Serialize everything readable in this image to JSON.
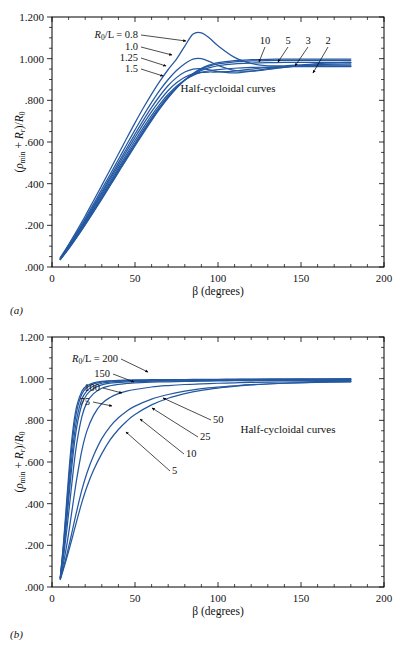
{
  "figure": {
    "background": "#ffffff",
    "curve_color": "#2458a0",
    "axis_color": "#000000"
  },
  "panels": [
    {
      "id": "a",
      "tag": "(a)",
      "annotation": "Half-cycloidal curves",
      "axis_label_x": "β (degrees)",
      "axis_label_y_parts": {
        "open": "(",
        "rho": "ρ",
        "rho_sub": "min",
        "plus": " + ",
        "R": "R",
        "R_sub": "r",
        "close": ")/",
        "R0": "R",
        "R0_sub": "0"
      },
      "series_legend_prefix": "R",
      "series_legend_prefix_sub": "0",
      "series_legend_text": "/L = 0.8",
      "left_labels": [
        "1.0",
        "1.25",
        "1.5"
      ],
      "right_labels": [
        "10",
        "5",
        "3",
        "2"
      ]
    },
    {
      "id": "b",
      "tag": "(b)",
      "annotation": "Half-cycloidal curves",
      "axis_label_x": "β (degrees)",
      "series_legend_text": "/L = 200",
      "left_labels": [
        "150",
        "100",
        "75"
      ],
      "right_labels": [
        "50",
        "25",
        "10",
        "5"
      ]
    }
  ],
  "chart_data": [
    {
      "type": "line",
      "panel": "a",
      "title": "",
      "annotation": "Half-cycloidal curves",
      "xlabel": "β (degrees)",
      "ylabel": "(ρmin + Rr)/R0",
      "xlim": [
        0,
        200
      ],
      "ylim": [
        0.0,
        1.2
      ],
      "xticks": [
        0,
        50,
        100,
        150,
        200
      ],
      "xticklabels": [
        "0",
        "50",
        "100",
        "150",
        "200"
      ],
      "yticks": [
        0.0,
        0.2,
        0.4,
        0.6,
        0.8,
        1.0,
        1.2
      ],
      "yticklabels": [
        ".000",
        ".200",
        ".400",
        ".600",
        ".800",
        "1.000",
        "1.200"
      ],
      "grid": false,
      "legend_position": "inline-labels",
      "x": [
        5,
        10,
        15,
        20,
        25,
        30,
        35,
        40,
        45,
        50,
        55,
        60,
        65,
        70,
        75,
        80,
        85,
        90,
        95,
        100,
        110,
        120,
        130,
        140,
        150,
        160,
        170,
        180
      ],
      "series": [
        {
          "name": "0.8",
          "label": "R0/L = 0.8",
          "values": [
            0.045,
            0.108,
            0.175,
            0.245,
            0.318,
            0.392,
            0.467,
            0.542,
            0.618,
            0.692,
            0.763,
            0.83,
            0.892,
            0.948,
            0.998,
            1.06,
            1.118,
            1.124,
            1.098,
            1.062,
            1.006,
            0.977,
            0.966,
            0.966,
            0.97,
            0.976,
            0.98,
            0.982
          ]
        },
        {
          "name": "1.0",
          "label": "1.0",
          "values": [
            0.042,
            0.102,
            0.166,
            0.233,
            0.302,
            0.373,
            0.444,
            0.516,
            0.588,
            0.658,
            0.726,
            0.79,
            0.849,
            0.9,
            0.943,
            0.976,
            0.998,
            1.0,
            0.986,
            0.968,
            0.944,
            0.94,
            0.948,
            0.958,
            0.966,
            0.971,
            0.974,
            0.975
          ]
        },
        {
          "name": "1.25",
          "label": "1.25",
          "values": [
            0.04,
            0.098,
            0.16,
            0.225,
            0.292,
            0.361,
            0.43,
            0.5,
            0.57,
            0.638,
            0.704,
            0.766,
            0.822,
            0.871,
            0.909,
            0.936,
            0.95,
            0.952,
            0.946,
            0.938,
            0.932,
            0.94,
            0.952,
            0.961,
            0.966,
            0.968,
            0.969,
            0.969
          ]
        },
        {
          "name": "1.5",
          "label": "1.5",
          "values": [
            0.039,
            0.095,
            0.156,
            0.219,
            0.285,
            0.352,
            0.42,
            0.488,
            0.556,
            0.622,
            0.686,
            0.746,
            0.8,
            0.847,
            0.884,
            0.911,
            0.927,
            0.934,
            0.936,
            0.936,
            0.94,
            0.95,
            0.958,
            0.962,
            0.964,
            0.964,
            0.964,
            0.964
          ]
        },
        {
          "name": "2",
          "label": "2",
          "values": [
            0.038,
            0.092,
            0.151,
            0.213,
            0.277,
            0.343,
            0.409,
            0.476,
            0.542,
            0.607,
            0.669,
            0.728,
            0.782,
            0.829,
            0.868,
            0.898,
            0.92,
            0.934,
            0.942,
            0.947,
            0.954,
            0.958,
            0.96,
            0.961,
            0.962,
            0.962,
            0.962,
            0.962
          ]
        },
        {
          "name": "3",
          "label": "3",
          "values": [
            0.037,
            0.09,
            0.147,
            0.208,
            0.271,
            0.335,
            0.4,
            0.466,
            0.531,
            0.595,
            0.657,
            0.716,
            0.771,
            0.82,
            0.862,
            0.897,
            0.924,
            0.944,
            0.957,
            0.966,
            0.975,
            0.979,
            0.981,
            0.982,
            0.982,
            0.982,
            0.982,
            0.982
          ]
        },
        {
          "name": "5",
          "label": "5",
          "values": [
            0.036,
            0.088,
            0.145,
            0.205,
            0.267,
            0.33,
            0.394,
            0.459,
            0.524,
            0.587,
            0.649,
            0.709,
            0.765,
            0.816,
            0.86,
            0.898,
            0.928,
            0.95,
            0.965,
            0.975,
            0.985,
            0.989,
            0.991,
            0.992,
            0.992,
            0.992,
            0.992,
            0.992
          ]
        },
        {
          "name": "10",
          "label": "10",
          "values": [
            0.036,
            0.087,
            0.143,
            0.202,
            0.263,
            0.326,
            0.39,
            0.454,
            0.518,
            0.581,
            0.643,
            0.703,
            0.76,
            0.812,
            0.858,
            0.897,
            0.929,
            0.954,
            0.97,
            0.981,
            0.991,
            0.995,
            0.997,
            0.998,
            0.998,
            0.998,
            0.998,
            0.998
          ]
        }
      ]
    },
    {
      "type": "line",
      "panel": "b",
      "title": "",
      "annotation": "Half-cycloidal curves",
      "xlabel": "β (degrees)",
      "ylabel": "(ρmin + Rr)/R0",
      "xlim": [
        0,
        200
      ],
      "ylim": [
        0.0,
        1.2
      ],
      "xticks": [
        0,
        50,
        100,
        150,
        200
      ],
      "xticklabels": [
        "0",
        "50",
        "100",
        "150",
        "200"
      ],
      "yticks": [
        0.0,
        0.2,
        0.4,
        0.6,
        0.8,
        1.0,
        1.2
      ],
      "yticklabels": [
        ".000",
        ".200",
        ".400",
        ".600",
        ".800",
        "1.000",
        "1.200"
      ],
      "grid": false,
      "legend_position": "inline-labels",
      "x": [
        5,
        7,
        9,
        11,
        13,
        15,
        18,
        21,
        25,
        30,
        35,
        40,
        45,
        50,
        60,
        70,
        80,
        90,
        100,
        110,
        120,
        140,
        160,
        180
      ],
      "series": [
        {
          "name": "200",
          "label": "R0/L = 200",
          "values": [
            0.046,
            0.22,
            0.43,
            0.63,
            0.78,
            0.872,
            0.94,
            0.966,
            0.98,
            0.987,
            0.99,
            0.992,
            0.993,
            0.994,
            0.995,
            0.996,
            0.996,
            0.997,
            0.997,
            0.998,
            0.998,
            0.999,
            0.999,
            1.0
          ]
        },
        {
          "name": "150",
          "label": "150",
          "values": [
            0.045,
            0.205,
            0.402,
            0.596,
            0.748,
            0.848,
            0.926,
            0.957,
            0.975,
            0.984,
            0.988,
            0.99,
            0.991,
            0.992,
            0.993,
            0.994,
            0.995,
            0.995,
            0.996,
            0.996,
            0.997,
            0.997,
            0.998,
            0.998
          ]
        },
        {
          "name": "100",
          "label": "100",
          "values": [
            0.044,
            0.186,
            0.362,
            0.546,
            0.7,
            0.81,
            0.902,
            0.941,
            0.965,
            0.978,
            0.984,
            0.987,
            0.988,
            0.989,
            0.991,
            0.992,
            0.993,
            0.993,
            0.994,
            0.994,
            0.995,
            0.995,
            0.996,
            0.996
          ]
        },
        {
          "name": "75",
          "label": "75",
          "values": [
            0.043,
            0.172,
            0.33,
            0.502,
            0.656,
            0.772,
            0.876,
            0.924,
            0.953,
            0.97,
            0.979,
            0.982,
            0.984,
            0.986,
            0.988,
            0.989,
            0.99,
            0.991,
            0.992,
            0.992,
            0.993,
            0.994,
            0.994,
            0.994
          ]
        },
        {
          "name": "50",
          "label": "50",
          "values": [
            0.042,
            0.15,
            0.28,
            0.426,
            0.572,
            0.694,
            0.818,
            0.885,
            0.928,
            0.954,
            0.966,
            0.973,
            0.977,
            0.98,
            0.983,
            0.985,
            0.987,
            0.988,
            0.989,
            0.99,
            0.99,
            0.991,
            0.992,
            0.992
          ]
        },
        {
          "name": "25",
          "label": "25",
          "values": [
            0.04,
            0.118,
            0.206,
            0.31,
            0.42,
            0.524,
            0.656,
            0.748,
            0.824,
            0.88,
            0.91,
            0.928,
            0.94,
            0.948,
            0.96,
            0.967,
            0.972,
            0.975,
            0.978,
            0.98,
            0.982,
            0.984,
            0.986,
            0.987
          ]
        },
        {
          "name": "10",
          "label": "10",
          "values": [
            0.038,
            0.096,
            0.158,
            0.226,
            0.298,
            0.368,
            0.466,
            0.546,
            0.63,
            0.712,
            0.77,
            0.812,
            0.844,
            0.868,
            0.902,
            0.924,
            0.94,
            0.952,
            0.96,
            0.966,
            0.971,
            0.978,
            0.982,
            0.985
          ]
        },
        {
          "name": "5",
          "label": "5",
          "values": [
            0.036,
            0.088,
            0.142,
            0.2,
            0.26,
            0.32,
            0.406,
            0.48,
            0.56,
            0.64,
            0.706,
            0.756,
            0.796,
            0.828,
            0.874,
            0.906,
            0.928,
            0.944,
            0.955,
            0.963,
            0.97,
            0.978,
            0.983,
            0.986
          ]
        }
      ]
    }
  ]
}
